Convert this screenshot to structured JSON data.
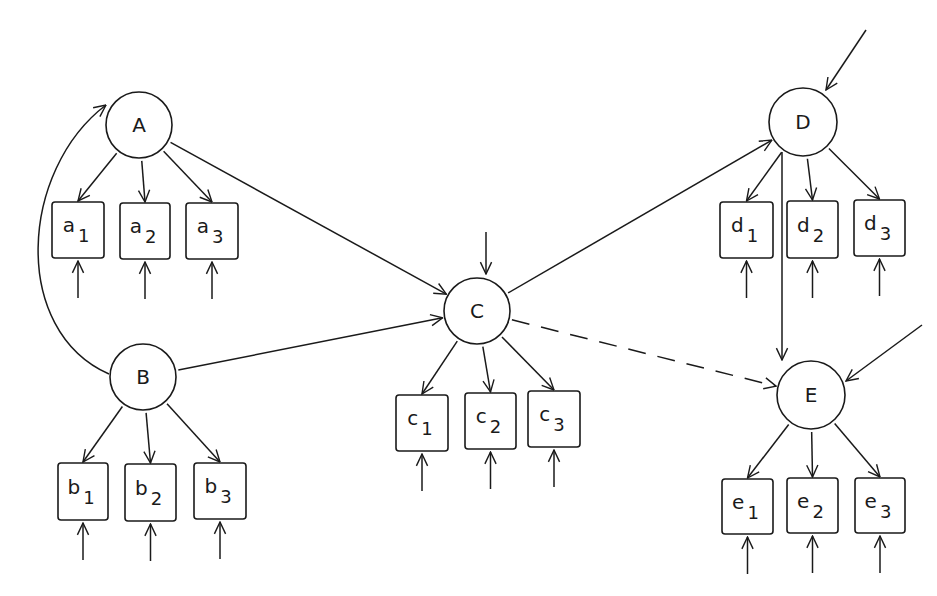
{
  "diagram": {
    "type": "path-diagram",
    "colors": {
      "ink": "#1a1a1a",
      "background": "#ffffff"
    },
    "latent": [
      {
        "id": "A",
        "label": "A",
        "cx": 139,
        "cy": 125,
        "r": 33
      },
      {
        "id": "B",
        "label": "B",
        "cx": 143,
        "cy": 377,
        "r": 33
      },
      {
        "id": "C",
        "label": "C",
        "cx": 477,
        "cy": 311,
        "r": 33
      },
      {
        "id": "D",
        "label": "D",
        "cx": 803,
        "cy": 122,
        "r": 34
      },
      {
        "id": "E",
        "label": "E",
        "cx": 811,
        "cy": 395,
        "r": 34
      }
    ],
    "indicators": [
      {
        "id": "a1",
        "base": "a",
        "sub": "1",
        "x": 52,
        "y": 202,
        "w": 52,
        "h": 56,
        "parent": "A"
      },
      {
        "id": "a2",
        "base": "a",
        "sub": "2",
        "x": 120,
        "y": 203,
        "w": 50,
        "h": 56,
        "parent": "A"
      },
      {
        "id": "a3",
        "base": "a",
        "sub": "3",
        "x": 186,
        "y": 203,
        "w": 52,
        "h": 56,
        "parent": "A"
      },
      {
        "id": "b1",
        "base": "b",
        "sub": "1",
        "x": 58,
        "y": 463,
        "w": 50,
        "h": 57,
        "parent": "B"
      },
      {
        "id": "b2",
        "base": "b",
        "sub": "2",
        "x": 125,
        "y": 464,
        "w": 51,
        "h": 57,
        "parent": "B"
      },
      {
        "id": "b3",
        "base": "b",
        "sub": "3",
        "x": 194,
        "y": 463,
        "w": 52,
        "h": 56,
        "parent": "B"
      },
      {
        "id": "c1",
        "base": "c",
        "sub": "1",
        "x": 396,
        "y": 395,
        "w": 52,
        "h": 56,
        "parent": "C"
      },
      {
        "id": "c2",
        "base": "c",
        "sub": "2",
        "x": 465,
        "y": 393,
        "w": 51,
        "h": 56,
        "parent": "C"
      },
      {
        "id": "c3",
        "base": "c",
        "sub": "3",
        "x": 528,
        "y": 391,
        "w": 52,
        "h": 56,
        "parent": "C"
      },
      {
        "id": "d1",
        "base": "d",
        "sub": "1",
        "x": 720,
        "y": 202,
        "w": 53,
        "h": 56,
        "parent": "D"
      },
      {
        "id": "d2",
        "base": "d",
        "sub": "2",
        "x": 787,
        "y": 201,
        "w": 51,
        "h": 57,
        "parent": "D"
      },
      {
        "id": "d3",
        "base": "d",
        "sub": "3",
        "x": 854,
        "y": 200,
        "w": 51,
        "h": 56,
        "parent": "D"
      },
      {
        "id": "e1",
        "base": "e",
        "sub": "1",
        "x": 722,
        "y": 479,
        "w": 51,
        "h": 55,
        "parent": "E"
      },
      {
        "id": "e2",
        "base": "e",
        "sub": "2",
        "x": 787,
        "y": 478,
        "w": 51,
        "h": 55,
        "parent": "E"
      },
      {
        "id": "e3",
        "base": "e",
        "sub": "3",
        "x": 855,
        "y": 478,
        "w": 50,
        "h": 55,
        "parent": "E"
      }
    ],
    "paths": [
      {
        "from": "A",
        "to": "C",
        "style": "solid"
      },
      {
        "from": "B",
        "to": "C",
        "style": "solid"
      },
      {
        "from": "B",
        "to": "A",
        "style": "solid-curved"
      },
      {
        "from": "C",
        "to": "D",
        "style": "solid"
      },
      {
        "from": "D",
        "to": "E",
        "style": "solid"
      },
      {
        "from": "C",
        "to": "E",
        "style": "dashed"
      }
    ],
    "disturbances": [
      "C",
      "D",
      "E"
    ],
    "error_terms": [
      "a1",
      "a2",
      "a3",
      "b1",
      "b2",
      "b3",
      "c1",
      "c2",
      "c3",
      "d1",
      "d2",
      "d3",
      "e1",
      "e2",
      "e3"
    ]
  }
}
